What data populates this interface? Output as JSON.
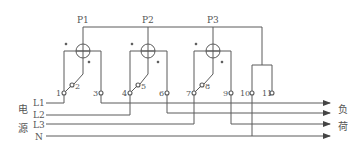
{
  "diagram": {
    "meters": [
      {
        "label": "P1"
      },
      {
        "label": "P2"
      },
      {
        "label": "P3"
      }
    ],
    "terminals": [
      "1",
      "2",
      "3",
      "4",
      "5",
      "6",
      "7",
      "8",
      "9",
      "10",
      "11"
    ],
    "source_lines": [
      "L1",
      "L2",
      "L3",
      "N"
    ],
    "source_label": [
      "电",
      "源"
    ],
    "load_label": [
      "负",
      "荷"
    ],
    "line_color": "#555555"
  }
}
